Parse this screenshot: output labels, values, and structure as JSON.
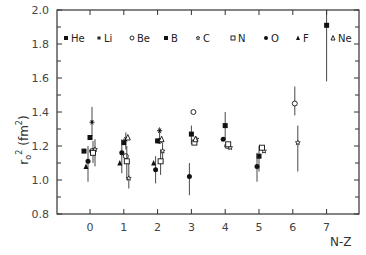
{
  "chart_data": {
    "type": "scatter",
    "title": "",
    "xlabel": "N-Z",
    "ylabel": "r₀² (fm²)",
    "xlim": [
      -1,
      8
    ],
    "ylim": [
      0.8,
      2.0
    ],
    "x_ticks": [
      "0",
      "1",
      "2",
      "3",
      "4",
      "5",
      "6",
      "7"
    ],
    "y_ticks": [
      "0.8",
      "1.0",
      "1.2",
      "1.4",
      "1.6",
      "1.8",
      "2.0"
    ],
    "grid": false,
    "legend_position": "top-inside",
    "series": [
      {
        "name": "He",
        "marker": "filled-square",
        "points": [
          {
            "x": 0,
            "y": 1.17
          }
        ]
      },
      {
        "name": "Li",
        "marker": "asterisk",
        "points": [
          {
            "x": 0,
            "y": 1.34
          },
          {
            "x": 1,
            "y": 1.24
          },
          {
            "x": 2,
            "y": 1.29
          }
        ]
      },
      {
        "name": "Be",
        "marker": "open-circle",
        "points": [
          {
            "x": 0,
            "y": 1.17
          },
          {
            "x": 1,
            "y": 1.14
          },
          {
            "x": 2,
            "y": 1.23
          },
          {
            "x": 3,
            "y": 1.4
          },
          {
            "x": 4,
            "y": 1.2
          },
          {
            "x": 6,
            "y": 1.45
          }
        ]
      },
      {
        "name": "B",
        "marker": "filled-square",
        "points": [
          {
            "x": 0,
            "y": 1.25
          },
          {
            "x": 1,
            "y": 1.22
          },
          {
            "x": 2,
            "y": 1.23
          },
          {
            "x": 3,
            "y": 1.27
          },
          {
            "x": 4,
            "y": 1.32
          },
          {
            "x": 5,
            "y": 1.14
          },
          {
            "x": 7,
            "y": 1.91
          }
        ]
      },
      {
        "name": "C",
        "marker": "open-star",
        "points": [
          {
            "x": 0,
            "y": 1.18
          },
          {
            "x": 1,
            "y": 1.01
          },
          {
            "x": 2,
            "y": 1.17
          },
          {
            "x": 3,
            "y": 1.24
          },
          {
            "x": 4,
            "y": 1.19
          },
          {
            "x": 5,
            "y": 1.17
          },
          {
            "x": 6,
            "y": 1.22
          }
        ]
      },
      {
        "name": "N",
        "marker": "open-square",
        "points": [
          {
            "x": 0,
            "y": 1.16
          },
          {
            "x": 1,
            "y": 1.11
          },
          {
            "x": 2,
            "y": 1.11
          },
          {
            "x": 3,
            "y": 1.22
          },
          {
            "x": 4,
            "y": 1.21
          },
          {
            "x": 5,
            "y": 1.19
          }
        ]
      },
      {
        "name": "O",
        "marker": "filled-circle",
        "points": [
          {
            "x": 0,
            "y": 1.11
          },
          {
            "x": 1,
            "y": 1.16
          },
          {
            "x": 2,
            "y": 1.06
          },
          {
            "x": 3,
            "y": 1.02
          },
          {
            "x": 4,
            "y": 1.24
          },
          {
            "x": 5,
            "y": 1.08
          }
        ]
      },
      {
        "name": "F",
        "marker": "filled-triangle",
        "points": [
          {
            "x": 0,
            "y": 1.08
          },
          {
            "x": 1,
            "y": 1.1
          },
          {
            "x": 2,
            "y": 1.1
          }
        ]
      },
      {
        "name": "Ne",
        "marker": "open-triangle",
        "points": [
          {
            "x": 1,
            "y": 1.25
          },
          {
            "x": 2,
            "y": 1.24
          },
          {
            "x": 3,
            "y": 1.24
          }
        ]
      }
    ]
  },
  "axes": {
    "xlabel": "N-Z",
    "ylabel_base": "r",
    "ylabel_sub": "o",
    "ylabel_sup": "2",
    "ylabel_unit": "(fm",
    "ylabel_unit_sup": "2",
    "ylabel_unit_close": ")"
  },
  "legend": [
    {
      "label": "He",
      "marker": "filled-square"
    },
    {
      "label": "Li",
      "marker": "asterisk"
    },
    {
      "label": "Be",
      "marker": "open-circle"
    },
    {
      "label": "B",
      "marker": "filled-square"
    },
    {
      "label": "C",
      "marker": "open-star"
    },
    {
      "label": "N",
      "marker": "open-square"
    },
    {
      "label": "O",
      "marker": "filled-circle"
    },
    {
      "label": "F",
      "marker": "filled-triangle"
    },
    {
      "label": "Ne",
      "marker": "open-triangle"
    }
  ]
}
